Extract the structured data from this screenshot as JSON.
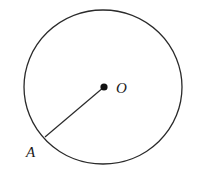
{
  "diagram": {
    "type": "geometry",
    "circle": {
      "cx": 103,
      "cy": 87,
      "rx": 79,
      "ry": 77,
      "stroke": "#2a2a2a"
    },
    "center": {
      "label": "O",
      "x": 104,
      "y": 87
    },
    "point_a": {
      "label": "A",
      "x": 45,
      "y": 137
    },
    "segments": [
      {
        "from": "O",
        "to": "A"
      }
    ]
  }
}
